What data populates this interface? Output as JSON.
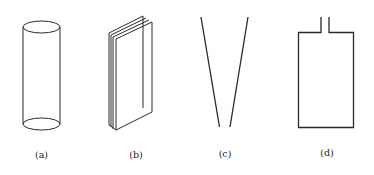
{
  "figure": {
    "panels": [
      {
        "id": "a",
        "label": "(a)",
        "shape": "cylinder"
      },
      {
        "id": "b",
        "label": "(b)",
        "shape": "stacked-plates"
      },
      {
        "id": "c",
        "label": "(c)",
        "shape": "tapered-v"
      },
      {
        "id": "d",
        "label": "(d)",
        "shape": "rectangular-container-with-neck"
      }
    ],
    "colors": {
      "line": "#2a2a2a",
      "background": "#ffffff"
    }
  }
}
